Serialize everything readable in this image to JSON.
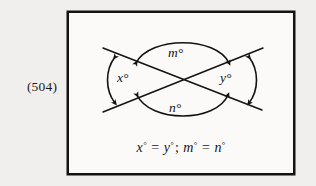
{
  "figure": {
    "number": "(504)",
    "caption_equation": "x° = y°; m° = n°",
    "equation_parts": {
      "x_sym": "x",
      "eq1": "=",
      "y_sym": "y",
      "separator": ";",
      "m_sym": "m",
      "eq2": "=",
      "n_sym": "n",
      "degree": "°"
    }
  },
  "diagram": {
    "type": "vertical-angles",
    "angle_labels": {
      "left": "x°",
      "right": "y°",
      "top": "m°",
      "bottom": "n°"
    },
    "intersection": {
      "x": 182,
      "y": 79
    },
    "lines": [
      {
        "name": "line-1",
        "x1": 103,
        "y1": 48,
        "x2": 262,
        "y2": 110
      },
      {
        "name": "line-2",
        "x1": 103,
        "y1": 112,
        "x2": 263,
        "y2": 48
      }
    ],
    "arcs": [
      {
        "name": "arc-left",
        "label": "x°"
      },
      {
        "name": "arc-right",
        "label": "y°"
      },
      {
        "name": "arc-top",
        "label": "m°"
      },
      {
        "name": "arc-bottom",
        "label": "n°"
      }
    ],
    "colors": {
      "ink": "#141414",
      "page_background": "#f1efed",
      "box_background": "#fbfaf9",
      "box_border": "#15130f"
    }
  }
}
